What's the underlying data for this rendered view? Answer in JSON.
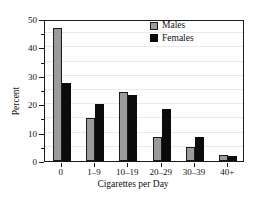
{
  "chart_data": {
    "type": "bar",
    "title": "",
    "xlabel": "Cigarettes per Day",
    "ylabel": "Percent",
    "categories": [
      "0",
      "1–9",
      "10–19",
      "20–29",
      "30–39",
      "40+"
    ],
    "series": [
      {
        "name": "Males",
        "color": "#9b9b9b",
        "values": [
          47.0,
          15.0,
          24.3,
          8.3,
          5.0,
          2.0
        ]
      },
      {
        "name": "Females",
        "color": "#0b0b0b",
        "values": [
          27.5,
          20.0,
          23.2,
          18.3,
          8.6,
          1.9
        ]
      }
    ],
    "ylim": [
      0,
      50
    ],
    "ytick_labels": [
      "0",
      "10",
      "20",
      "30",
      "40",
      "50"
    ],
    "ytick_values": [
      0,
      10,
      20,
      30,
      40,
      50
    ],
    "yminor_values": [
      5,
      15,
      25,
      35,
      45
    ],
    "grid": true,
    "legend_position": "top-right"
  },
  "axes": {
    "y_title": "Percent",
    "x_title": "Cigarettes per Day"
  },
  "legend": {
    "items": [
      {
        "label": "Males"
      },
      {
        "label": "Females"
      }
    ]
  }
}
